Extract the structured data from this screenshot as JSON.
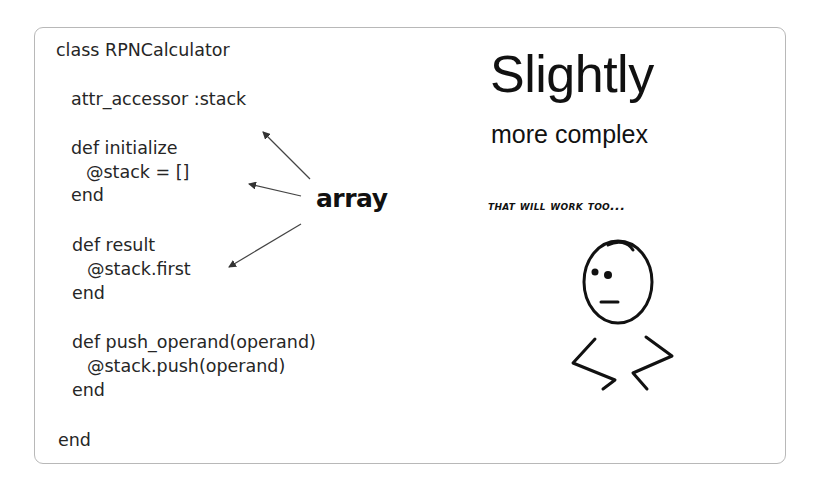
{
  "slide": {
    "code_lines": [
      {
        "text": "class RPNCalculator",
        "x": 56,
        "y": 44
      },
      {
        "text": "attr_accessor :stack",
        "x": 71,
        "y": 93
      },
      {
        "text": "def initialize",
        "x": 71,
        "y": 142
      },
      {
        "text": "@stack = []",
        "x": 86,
        "y": 166
      },
      {
        "text": "end",
        "x": 71,
        "y": 189
      },
      {
        "text": "def result",
        "x": 72,
        "y": 239
      },
      {
        "text": "@stack.first",
        "x": 87,
        "y": 263
      },
      {
        "text": "end",
        "x": 72,
        "y": 287
      },
      {
        "text": "def push_operand(operand)",
        "x": 72,
        "y": 336
      },
      {
        "text": "@stack.push(operand)",
        "x": 87,
        "y": 360
      },
      {
        "text": "end",
        "x": 72,
        "y": 384
      },
      {
        "text": "end",
        "x": 58,
        "y": 434
      }
    ],
    "heading": "Slightly",
    "subheading": "more complex",
    "caption": "That will work too...",
    "annotation": "array",
    "colors": {
      "text": "#262626",
      "border": "#b8b8b8",
      "ink": "#111111"
    }
  }
}
